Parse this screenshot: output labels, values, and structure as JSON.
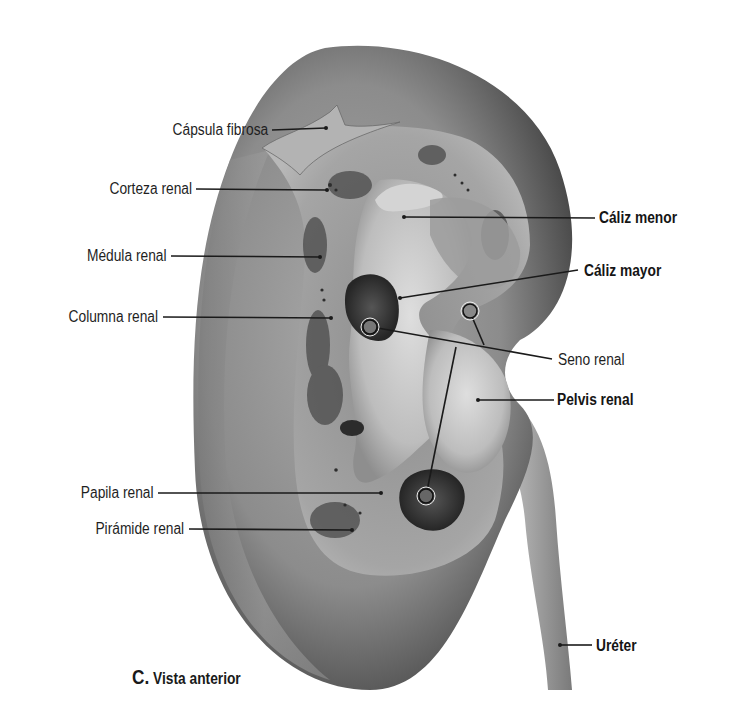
{
  "figure": {
    "caption_letter": "C.",
    "caption_text": "Vista anterior",
    "colors": {
      "background": "#ffffff",
      "kidney_surface": "#8a8a8a",
      "kidney_shadow": "#4a4a4a",
      "cortex": "#a8a8a8",
      "medulla_dark": "#3c3c3c",
      "sinus_light": "#c8c8c8",
      "leader_line": "#1a1a1a",
      "label_text": "#1f1f1f"
    },
    "labels_left": [
      {
        "text": "Cápsula fibrosa",
        "bold": false
      },
      {
        "text": "Corteza renal",
        "bold": false
      },
      {
        "text": "Médula renal",
        "bold": false
      },
      {
        "text": "Columna renal",
        "bold": false
      },
      {
        "text": "Papila renal",
        "bold": false
      },
      {
        "text": "Pirámide renal",
        "bold": false
      }
    ],
    "labels_right": [
      {
        "text": "Cáliz menor",
        "bold": true
      },
      {
        "text": "Cáliz mayor",
        "bold": true
      },
      {
        "text": "Seno renal",
        "bold": false
      },
      {
        "text": "Pelvis renal",
        "bold": true
      },
      {
        "text": "Uréter",
        "bold": true
      }
    ]
  }
}
